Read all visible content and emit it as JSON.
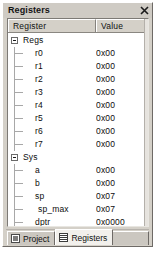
{
  "window": {
    "title": "Registers",
    "close_icon": "close-icon",
    "scrollbar": "vertical-scrollbar"
  },
  "grid": {
    "columns": [
      {
        "key": "register",
        "label": "Register"
      },
      {
        "key": "value",
        "label": "Value"
      }
    ],
    "rows": [
      {
        "name": "Regs",
        "value": "",
        "level": 0,
        "type": "group",
        "expanded": true,
        "twisty": "minus-box-icon"
      },
      {
        "name": "r0",
        "value": "0x00",
        "level": 1,
        "type": "leaf"
      },
      {
        "name": "r1",
        "value": "0x00",
        "level": 1,
        "type": "leaf"
      },
      {
        "name": "r2",
        "value": "0x00",
        "level": 1,
        "type": "leaf"
      },
      {
        "name": "r3",
        "value": "0x00",
        "level": 1,
        "type": "leaf"
      },
      {
        "name": "r4",
        "value": "0x00",
        "level": 1,
        "type": "leaf"
      },
      {
        "name": "r5",
        "value": "0x00",
        "level": 1,
        "type": "leaf"
      },
      {
        "name": "r6",
        "value": "0x00",
        "level": 1,
        "type": "leaf"
      },
      {
        "name": "r7",
        "value": "0x00",
        "level": 1,
        "type": "leaf"
      },
      {
        "name": "Sys",
        "value": "",
        "level": 0,
        "type": "group",
        "expanded": true,
        "twisty": "minus-box-icon"
      },
      {
        "name": "a",
        "value": "0x00",
        "level": 1,
        "type": "leaf"
      },
      {
        "name": "b",
        "value": "0x00",
        "level": 1,
        "type": "leaf"
      },
      {
        "name": "sp",
        "value": "0x07",
        "level": 1,
        "type": "leaf"
      },
      {
        "name": "sp_max",
        "value": "0x07",
        "level": 1,
        "type": "leaf2"
      },
      {
        "name": "dptr",
        "value": "0x0000",
        "level": 1,
        "type": "leaf"
      },
      {
        "name": "PC $",
        "value": "C:0x000A",
        "level": 1,
        "type": "leaf"
      },
      {
        "name": "states",
        "value": "5",
        "level": 1,
        "type": "leaf"
      },
      {
        "name": "sec",
        "value": "0.00000543",
        "level": 1,
        "type": "leaf"
      },
      {
        "name": "psw",
        "value": "0x00",
        "level": 0,
        "type": "group",
        "expanded": false,
        "twisty": "plus-box-icon"
      }
    ]
  },
  "tabs": [
    {
      "label": "Project",
      "icon": "project-window-icon",
      "active": false
    },
    {
      "label": "Registers",
      "icon": "registers-grid-icon",
      "active": true
    }
  ]
}
